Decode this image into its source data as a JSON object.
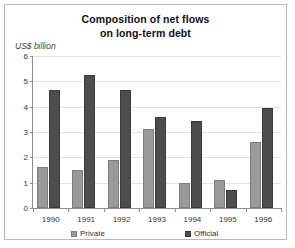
{
  "chart_data": {
    "type": "bar",
    "title": "Composition of net flows on long-term debt",
    "title_lines": [
      "Composition of net flows",
      "on long-term debt"
    ],
    "xlabel": "",
    "ylabel": "US$ billion",
    "ylim": [
      0,
      6
    ],
    "yticks": [
      0,
      1,
      2,
      3,
      4,
      5,
      6
    ],
    "ytick_labels": [
      "0",
      "1",
      "2",
      "3",
      "4",
      "5",
      "6"
    ],
    "grid": true,
    "legend_position": "bottom",
    "categories": [
      "1990",
      "1991",
      "1992",
      "1993",
      "1994",
      "1995",
      "1996"
    ],
    "series": [
      {
        "name": "Private",
        "color": "#9a9a9a",
        "values": [
          1.6,
          1.5,
          1.9,
          3.1,
          1.0,
          1.1,
          2.6
        ]
      },
      {
        "name": "Official",
        "color": "#4d4d4d",
        "values": [
          4.65,
          5.25,
          4.65,
          3.6,
          3.45,
          0.7,
          3.95
        ]
      }
    ]
  },
  "legend": {
    "entries": [
      {
        "label": "Private",
        "swatch": "legend-swatch-private"
      },
      {
        "label": "Official",
        "swatch": "legend-swatch-official"
      }
    ]
  }
}
